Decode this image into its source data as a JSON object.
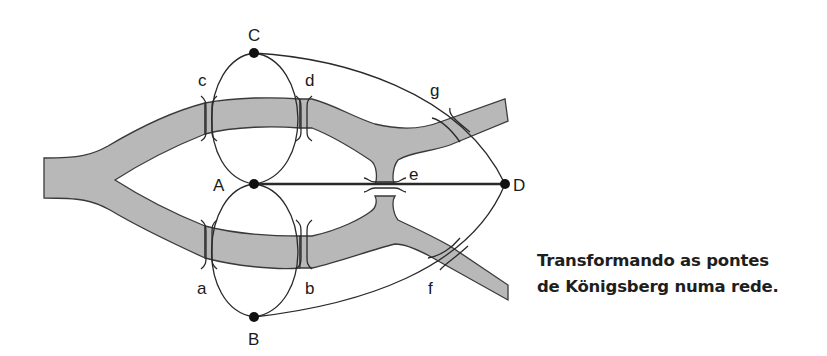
{
  "diagram": {
    "nodes": [
      {
        "id": "C",
        "label": "C"
      },
      {
        "id": "A",
        "label": "A"
      },
      {
        "id": "B",
        "label": "B"
      },
      {
        "id": "D",
        "label": "D"
      }
    ],
    "bridges": [
      {
        "id": "a",
        "label": "a",
        "connects": [
          "A",
          "B"
        ]
      },
      {
        "id": "b",
        "label": "b",
        "connects": [
          "A",
          "B"
        ]
      },
      {
        "id": "c",
        "label": "c",
        "connects": [
          "A",
          "C"
        ]
      },
      {
        "id": "d",
        "label": "d",
        "connects": [
          "A",
          "C"
        ]
      },
      {
        "id": "e",
        "label": "e",
        "connects": [
          "A",
          "D"
        ]
      },
      {
        "id": "f",
        "label": "f",
        "connects": [
          "B",
          "D"
        ]
      },
      {
        "id": "g",
        "label": "g",
        "connects": [
          "C",
          "D"
        ]
      }
    ],
    "colors": {
      "river": "#b8b8b8",
      "river_edge": "#3a3a3a",
      "edge": "#2a2a2a",
      "node": "#111111"
    }
  },
  "caption": {
    "line1": "Transformando as pontes",
    "line2": "de Königsberg numa rede."
  }
}
